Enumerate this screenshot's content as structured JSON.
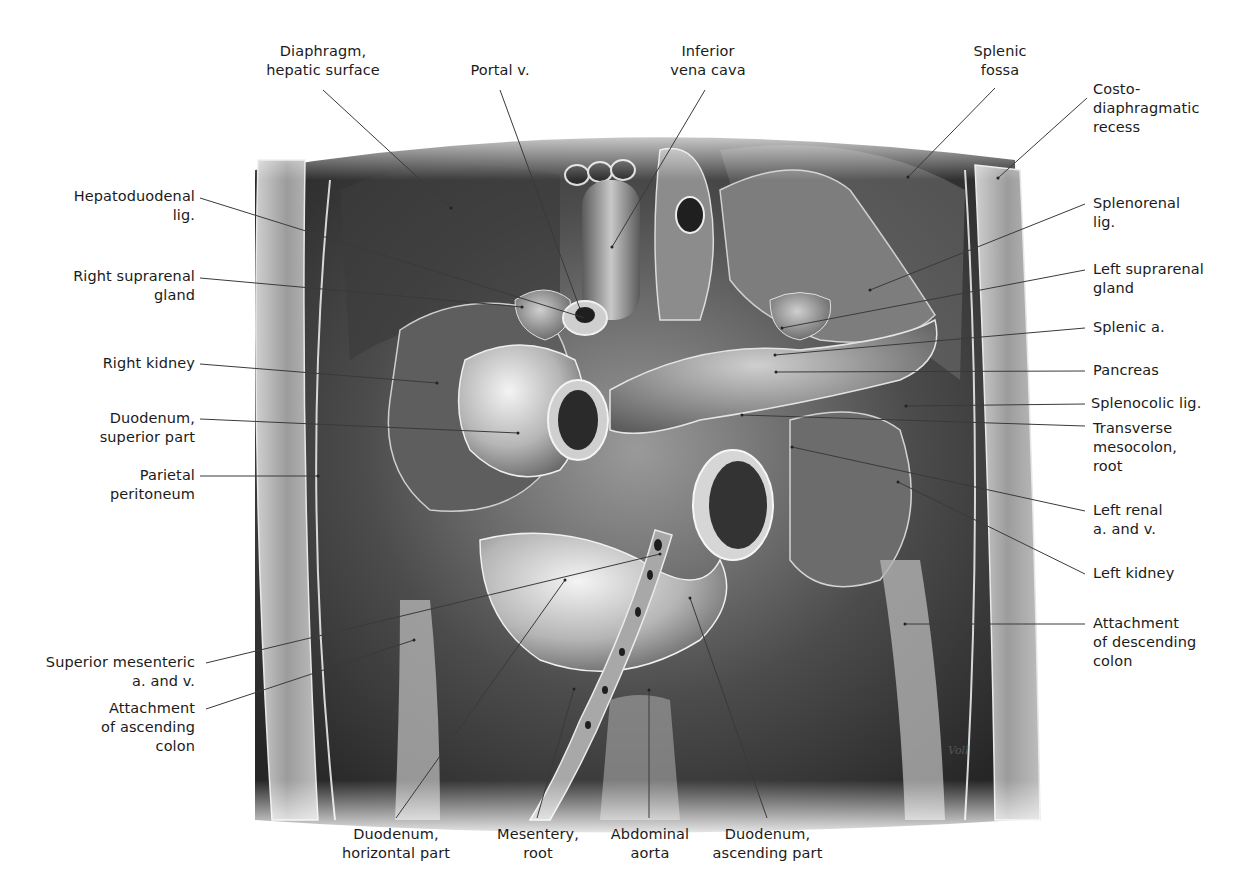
{
  "figure": {
    "artist_signature": "Voll",
    "colors": {
      "background": "#ffffff",
      "label_text": "#1b1b1b",
      "leader_line": "#3a3a3a",
      "illustration_dark": "#2a2a2a",
      "illustration_mid": "#8a8a8a",
      "illustration_light": "#e6e6e6"
    }
  },
  "labels": {
    "left": [
      {
        "id": "hepatoduodenal-lig",
        "text": "Hepatoduodenal\nlig."
      },
      {
        "id": "right-suprarenal-gland",
        "text": "Right suprarenal\ngland"
      },
      {
        "id": "right-kidney",
        "text": "Right kidney"
      },
      {
        "id": "duodenum-superior-part",
        "text": "Duodenum,\nsuperior part"
      },
      {
        "id": "parietal-peritoneum",
        "text": "Parietal\nperitoneum"
      },
      {
        "id": "superior-mesenteric-a-v",
        "text": "Superior mesenteric\na. and v."
      },
      {
        "id": "attachment-ascending-colon",
        "text": "Attachment\nof ascending\ncolon"
      }
    ],
    "top": [
      {
        "id": "diaphragm-hepatic-surface",
        "text": "Diaphragm,\nhepatic surface"
      },
      {
        "id": "portal-v",
        "text": "Portal v."
      },
      {
        "id": "inferior-vena-cava",
        "text": "Inferior\nvena cava"
      },
      {
        "id": "splenic-fossa",
        "text": "Splenic\nfossa"
      }
    ],
    "right": [
      {
        "id": "costodiaphragmatic-recess",
        "text": "Costo-\ndiaphragmatic\nrecess"
      },
      {
        "id": "splenorenal-lig",
        "text": "Splenorenal\nlig."
      },
      {
        "id": "left-suprarenal-gland",
        "text": "Left suprarenal\ngland"
      },
      {
        "id": "splenic-a",
        "text": "Splenic a."
      },
      {
        "id": "pancreas",
        "text": "Pancreas"
      },
      {
        "id": "splenocolic-lig",
        "text": "Splenocolic lig."
      },
      {
        "id": "transverse-mesocolon-root",
        "text": "Transverse\nmesocolon,\nroot"
      },
      {
        "id": "left-renal-a-v",
        "text": "Left renal\na. and v."
      },
      {
        "id": "left-kidney",
        "text": "Left kidney"
      },
      {
        "id": "attachment-descending-colon",
        "text": "Attachment\nof descending\ncolon"
      }
    ],
    "bottom": [
      {
        "id": "duodenum-horizontal-part",
        "text": "Duodenum,\nhorizontal part"
      },
      {
        "id": "mesentery-root",
        "text": "Mesentery,\nroot"
      },
      {
        "id": "abdominal-aorta",
        "text": "Abdominal\naorta"
      },
      {
        "id": "duodenum-ascending-part",
        "text": "Duodenum,\nascending part"
      }
    ]
  }
}
